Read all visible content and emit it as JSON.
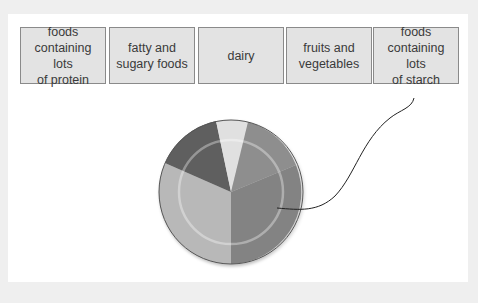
{
  "labels": [
    {
      "text": "foods\ncontaining lots\nof protein"
    },
    {
      "text": "fatty and\nsugary foods"
    },
    {
      "text": "dairy"
    },
    {
      "text": "fruits and\nvegetables"
    },
    {
      "text": "foods\ncontaining lots\nof starch"
    }
  ],
  "plate": {
    "segments": [
      {
        "name": "fruits-and-vegetables",
        "color": "#b8b8b8"
      },
      {
        "name": "protein",
        "color": "#5e5e5e"
      },
      {
        "name": "fatty-sugary",
        "color": "#e0e0e0"
      },
      {
        "name": "dairy",
        "color": "#8e8e8e"
      },
      {
        "name": "starch",
        "color": "#838383"
      }
    ],
    "pointer_target": "foods containing lots of starch"
  }
}
